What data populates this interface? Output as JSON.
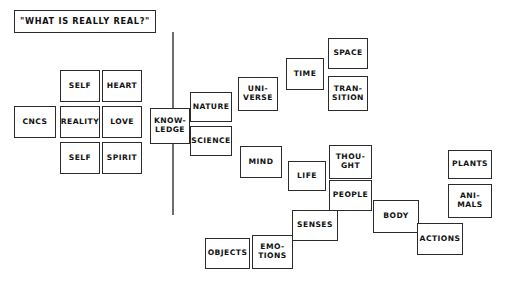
{
  "diagram": {
    "kind": "concept-map",
    "background_color": "#ffffff",
    "node_border_color": "#2b2b2b",
    "node_fill_color": "#ffffff",
    "text_color": "#111111",
    "spine_color": "#6d6d6d",
    "title": {
      "label": "\"WHAT IS REALLY REAL?\"",
      "x": 14,
      "y": 10,
      "w": 142,
      "h": 23
    },
    "spine": {
      "x": 172,
      "y": 32,
      "h": 183
    },
    "nodes": [
      {
        "id": "cncs",
        "label": "CNCS",
        "x": 14,
        "y": 106,
        "w": 42,
        "h": 32
      },
      {
        "id": "self-top",
        "label": "SELF",
        "x": 60,
        "y": 70,
        "w": 40,
        "h": 32
      },
      {
        "id": "heart",
        "label": "HEART",
        "x": 102,
        "y": 70,
        "w": 40,
        "h": 32
      },
      {
        "id": "reality",
        "label": "REALITY",
        "x": 60,
        "y": 106,
        "w": 40,
        "h": 32
      },
      {
        "id": "love",
        "label": "LOVE",
        "x": 102,
        "y": 106,
        "w": 40,
        "h": 32
      },
      {
        "id": "self-bot",
        "label": "SELF",
        "x": 60,
        "y": 142,
        "w": 40,
        "h": 32
      },
      {
        "id": "spirit",
        "label": "SPIRIT",
        "x": 102,
        "y": 142,
        "w": 40,
        "h": 32
      },
      {
        "id": "knowledge",
        "label": "KNOW-\nLEDGE",
        "x": 150,
        "y": 108,
        "w": 40,
        "h": 36
      },
      {
        "id": "nature",
        "label": "NATURE",
        "x": 190,
        "y": 92,
        "w": 42,
        "h": 30
      },
      {
        "id": "science",
        "label": "SCIENCE",
        "x": 190,
        "y": 126,
        "w": 42,
        "h": 30
      },
      {
        "id": "universe",
        "label": "UNI-\nVERSE",
        "x": 238,
        "y": 77,
        "w": 40,
        "h": 34
      },
      {
        "id": "time",
        "label": "TIME",
        "x": 286,
        "y": 58,
        "w": 38,
        "h": 32
      },
      {
        "id": "space",
        "label": "SPACE",
        "x": 328,
        "y": 38,
        "w": 40,
        "h": 31
      },
      {
        "id": "transition",
        "label": "TRAN-\nSITION",
        "x": 328,
        "y": 76,
        "w": 40,
        "h": 35
      },
      {
        "id": "mind",
        "label": "MIND",
        "x": 240,
        "y": 146,
        "w": 42,
        "h": 32
      },
      {
        "id": "life",
        "label": "LIFE",
        "x": 288,
        "y": 161,
        "w": 38,
        "h": 30
      },
      {
        "id": "thought",
        "label": "THOU-\nGHT",
        "x": 329,
        "y": 145,
        "w": 43,
        "h": 34
      },
      {
        "id": "people",
        "label": "PEOPLE",
        "x": 329,
        "y": 180,
        "w": 43,
        "h": 31
      },
      {
        "id": "senses",
        "label": "SENSES",
        "x": 292,
        "y": 210,
        "w": 46,
        "h": 31
      },
      {
        "id": "emotions",
        "label": "EMO-\nTIONS",
        "x": 252,
        "y": 235,
        "w": 41,
        "h": 34
      },
      {
        "id": "objects",
        "label": "OBJECTS",
        "x": 205,
        "y": 238,
        "w": 45,
        "h": 31
      },
      {
        "id": "body",
        "label": "BODY",
        "x": 373,
        "y": 200,
        "w": 46,
        "h": 33
      },
      {
        "id": "actions",
        "label": "ACTIONS",
        "x": 417,
        "y": 223,
        "w": 46,
        "h": 32
      },
      {
        "id": "plants",
        "label": "PLANTS",
        "x": 448,
        "y": 150,
        "w": 44,
        "h": 29
      },
      {
        "id": "animals",
        "label": "ANI-\nMALS",
        "x": 448,
        "y": 184,
        "w": 44,
        "h": 34
      }
    ]
  }
}
